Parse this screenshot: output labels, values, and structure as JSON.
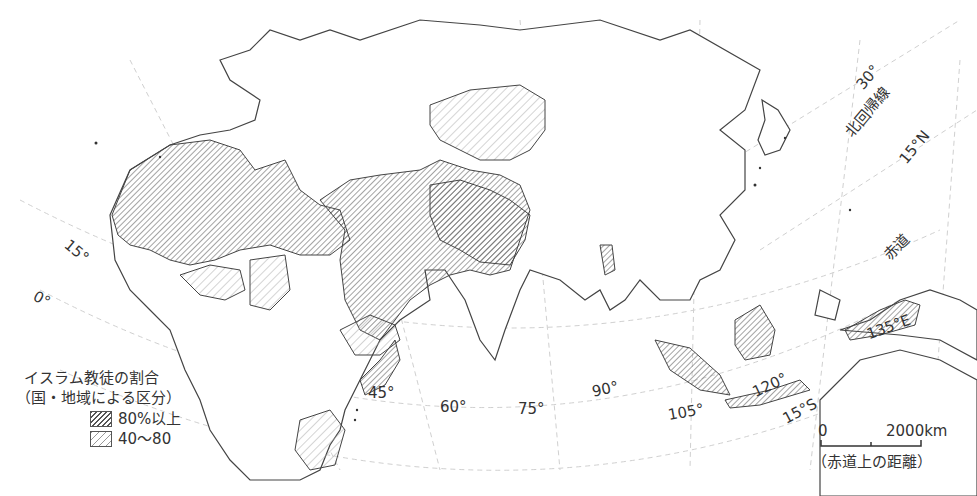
{
  "map": {
    "title": "イスラム教徒の割合",
    "subtitle": "（国・地域による区分）",
    "legend": [
      {
        "label": "80%以上",
        "pattern": "dense-hatch"
      },
      {
        "label": "40〜80",
        "pattern": "light-hatch"
      }
    ],
    "graticule_labels": {
      "longitude": [
        "45°",
        "60°",
        "75°",
        "90°",
        "105°",
        "120°",
        "135°E"
      ],
      "latitude": [
        "0°",
        "15°",
        "15°S",
        "15°N",
        "30°"
      ],
      "lines": [
        "北回帰線",
        "赤道"
      ]
    },
    "scale_bar": {
      "start": "0",
      "end": "2000km",
      "note": "（赤道上の距離）"
    },
    "colors": {
      "outline": "#444444",
      "hatch_dense": "#555555",
      "hatch_light": "#999999",
      "graticule": "#cccccc",
      "background": "#ffffff"
    }
  }
}
